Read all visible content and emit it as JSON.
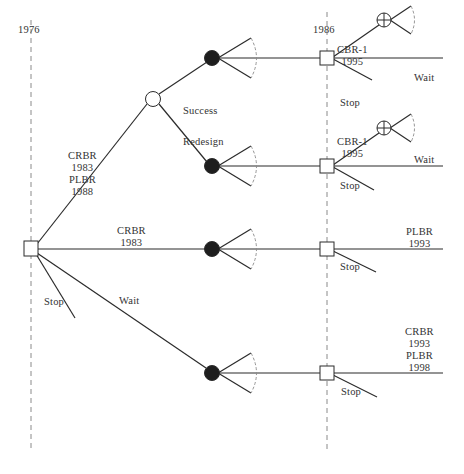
{
  "diagram": {
    "timeline": [
      {
        "label": "1976",
        "x": 31
      },
      {
        "label": "1986",
        "x": 327
      }
    ],
    "colors": {
      "line": "#2b2b2b",
      "dashed": "#8a8a8a",
      "chance_fill": "#1e1e1e",
      "background": "#ffffff"
    },
    "nodes": {
      "root_decision": {
        "type": "decision-square",
        "x": 31,
        "y": 249
      },
      "chance_open": {
        "type": "chance-open",
        "x": 153,
        "y": 99
      },
      "chance_success": {
        "type": "chance-filled",
        "x": 212,
        "y": 58
      },
      "chance_redesign": {
        "type": "chance-filled",
        "x": 212,
        "y": 166
      },
      "chance_crbr": {
        "type": "chance-filled",
        "x": 212,
        "y": 249
      },
      "chance_wait": {
        "type": "chance-filled",
        "x": 212,
        "y": 373
      },
      "decision_1986_a": {
        "type": "decision-square",
        "x": 327,
        "y": 58
      },
      "decision_1986_b": {
        "type": "decision-square",
        "x": 327,
        "y": 166
      },
      "decision_1986_c": {
        "type": "decision-square",
        "x": 327,
        "y": 249
      },
      "decision_1986_d": {
        "type": "decision-square",
        "x": 327,
        "y": 373
      },
      "cbr_a": {
        "type": "chance-crossed",
        "x": 384,
        "y": 20
      },
      "cbr_b": {
        "type": "chance-crossed",
        "x": 384,
        "y": 128
      }
    },
    "labels": {
      "year_1976": "1976",
      "year_1986": "1986",
      "branch_crbr_plbr": [
        "CRBR",
        "1983",
        "PLBR",
        "1988"
      ],
      "branch_crbr": [
        "CRBR",
        "1983"
      ],
      "branch_wait": "Wait",
      "branch_stop_root": "Stop",
      "outcome_success": "Success",
      "outcome_redesign": "Redesign",
      "cbr_a": [
        "CBR-1",
        "1995"
      ],
      "cbr_b": [
        "CBR-1",
        "1995"
      ],
      "wait_a": "Wait",
      "wait_b": "Wait",
      "stop_a": "Stop",
      "stop_b": "Stop",
      "stop_c": "Stop",
      "stop_d": "Stop",
      "plbr_1993": [
        "PLBR",
        "1993"
      ],
      "crbr_plbr_late": [
        "CRBR",
        "1993",
        "PLBR",
        "1998"
      ]
    }
  }
}
